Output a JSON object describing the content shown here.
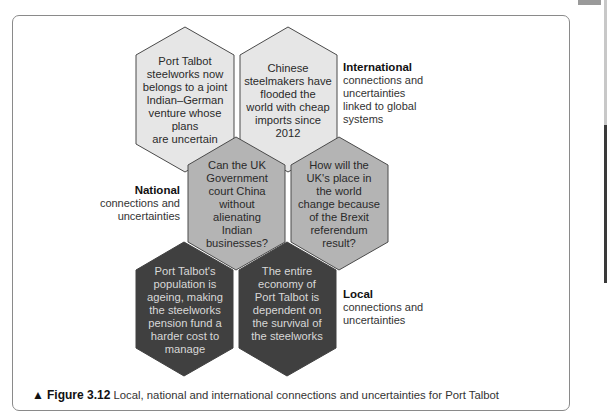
{
  "figure": {
    "marker": "▲",
    "number": "Figure 3.12",
    "caption": "Local, national and international connections and uncertainties for Port Talbot"
  },
  "hexagons": {
    "international_1": {
      "level": "international",
      "text": "Port Talbot steelworks now belongs to a joint Indian–German venture whose plans are uncertain",
      "lines": [
        "Port Talbot",
        "steelworks now",
        "belongs to a joint",
        "Indian–German",
        "venture whose plans",
        "are uncertain"
      ]
    },
    "international_2": {
      "level": "international",
      "text": "Chinese steelmakers have flooded the world with cheap imports since 2012",
      "lines": [
        "Chinese",
        "steelmakers have",
        "flooded the",
        "world with cheap",
        "imports since",
        "2012"
      ]
    },
    "national_1": {
      "level": "national",
      "text": "Can the UK Government court China without alienating Indian businesses?",
      "lines": [
        "Can the UK",
        "Government",
        "court China",
        "without",
        "alienating",
        "Indian",
        "businesses?"
      ]
    },
    "national_2": {
      "level": "national",
      "text": "How will the UK's place in the world change because of the Brexit referendum result?",
      "lines": [
        "How will the",
        "UK's place in",
        "the world",
        "change because",
        "of the Brexit",
        "referendum",
        "result?"
      ]
    },
    "local_1": {
      "level": "local",
      "text": "Port Talbot's population is ageing, making the steelworks pension fund a harder cost to manage",
      "lines": [
        "Port Talbot's",
        "population is",
        "ageing, making",
        "the steelworks",
        "pension fund a",
        "harder cost to",
        "manage"
      ]
    },
    "local_2": {
      "level": "local",
      "text": "The entire economy of Port Talbot is dependent on the survival of the steelworks",
      "lines": [
        "The entire",
        "economy of",
        "Port Talbot is",
        "dependent on",
        "the survival of",
        "the steelworks"
      ]
    }
  },
  "labels": {
    "international": {
      "title": "International",
      "lines": [
        "connections and",
        "uncertainties",
        "linked to global",
        "systems"
      ]
    },
    "national": {
      "title": "National",
      "lines": [
        "connections and",
        "uncertainties"
      ]
    },
    "local": {
      "title": "Local",
      "lines": [
        "connections and",
        "uncertainties"
      ]
    }
  },
  "colors": {
    "international_fill": "#e6e6e6",
    "national_fill": "#b4b4b4",
    "local_fill": "#404040",
    "outline": "#4a4a4a"
  }
}
